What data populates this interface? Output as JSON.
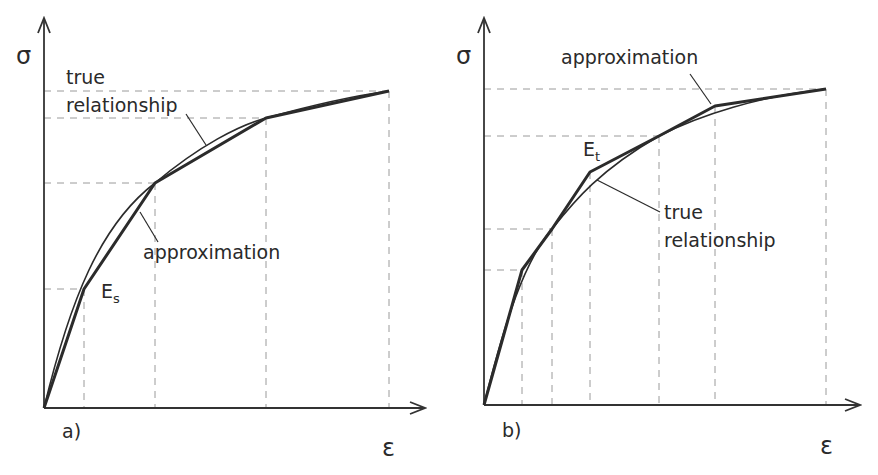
{
  "panels": [
    {
      "id": "a",
      "label": "a)",
      "y_axis_label": "σ",
      "x_axis_label": "ε",
      "annotations": {
        "true_relationship_line1": "true",
        "true_relationship_line2": "relationship",
        "approximation": "approximation",
        "modulus_base": "E",
        "modulus_sub": "s"
      },
      "method": "secant"
    },
    {
      "id": "b",
      "label": "b)",
      "y_axis_label": "σ",
      "x_axis_label": "ε",
      "annotations": {
        "approximation": "approximation",
        "true_relationship_line1": "true",
        "true_relationship_line2": "relationship",
        "modulus_base": "E",
        "modulus_sub": "t"
      },
      "method": "tangent"
    }
  ],
  "colors": {
    "curve": "#2b2b2b",
    "axis": "#333333",
    "grid": "#9a9a9a",
    "text": "#2a2a2a"
  }
}
